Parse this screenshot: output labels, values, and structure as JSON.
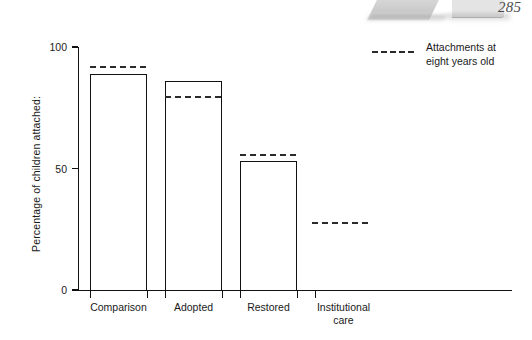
{
  "page": {
    "number": "285"
  },
  "chart_data": {
    "type": "bar",
    "title": "",
    "xlabel": "",
    "ylabel": "Percentage of children attached:",
    "ylim": [
      0,
      100
    ],
    "yticks": [
      0,
      50,
      100
    ],
    "ytick_labels": [
      "0",
      "50",
      "100"
    ],
    "grid": false,
    "categories": [
      "Comparison",
      "Adopted",
      "Restored",
      "Institutional care"
    ],
    "category_lines": [
      [
        "Comparison"
      ],
      [
        "Adopted"
      ],
      [
        "Restored"
      ],
      [
        "Institutional",
        "care"
      ]
    ],
    "series": [
      {
        "name": "Bars",
        "style": "bar-outline",
        "values": [
          89,
          86,
          53,
          null
        ]
      },
      {
        "name": "Attachments at eight years old",
        "style": "dashed-marker",
        "values": [
          92,
          80,
          56,
          28
        ]
      }
    ],
    "legend": {
      "position": "top-right",
      "entries": [
        {
          "label": "Attachments at\neight years old",
          "marker": "dashed-line",
          "color": "#2a2a2a"
        }
      ]
    },
    "colors": {
      "bar_outline": "#111111",
      "bar_fill": "#ffffff",
      "dash": "#2a2a2a",
      "axis": "#111111",
      "text": "#1a1a1a"
    }
  },
  "geometry": {
    "y_top_px": 47,
    "y_zero_px": 290,
    "axis_x_px": 78,
    "axis_right_px": 512,
    "bar_width_px": 57,
    "bar_lefts_px": [
      90,
      165,
      240,
      315
    ],
    "dash_width_px": 56,
    "dash_lefts_px": [
      90,
      165,
      240,
      312
    ]
  }
}
